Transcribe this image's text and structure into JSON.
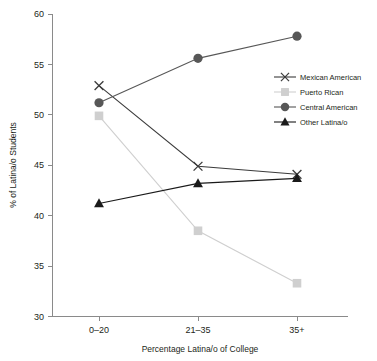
{
  "chart_data": {
    "type": "line",
    "title": "",
    "xlabel": "Percentage Latina/o of College",
    "ylabel": "% of Latina/o Students",
    "categories": [
      "0–20",
      "21–35",
      "35+"
    ],
    "ylim": [
      30,
      60
    ],
    "yticks": [
      30,
      35,
      40,
      45,
      50,
      55,
      60
    ],
    "ytick_labels": [
      "30",
      "35",
      "40",
      "45",
      "50",
      "55",
      "60"
    ],
    "grid": false,
    "legend_position": "right-upper",
    "series": [
      {
        "name": "Mexican American",
        "marker": "x",
        "color": "#3b3b3b",
        "values": [
          52.9,
          44.9,
          44.1
        ]
      },
      {
        "name": "Puerto Rican",
        "marker": "square",
        "color": "#cfcfcf",
        "values": [
          49.9,
          38.5,
          33.3
        ]
      },
      {
        "name": "Central American",
        "marker": "circle",
        "color": "#575757",
        "values": [
          51.2,
          55.6,
          57.8
        ]
      },
      {
        "name": "Other Latina/o",
        "marker": "triangle",
        "color": "#1a1a1a",
        "values": [
          41.2,
          43.2,
          43.7
        ]
      }
    ]
  },
  "axis": {
    "line_color": "#8a8a8a"
  }
}
